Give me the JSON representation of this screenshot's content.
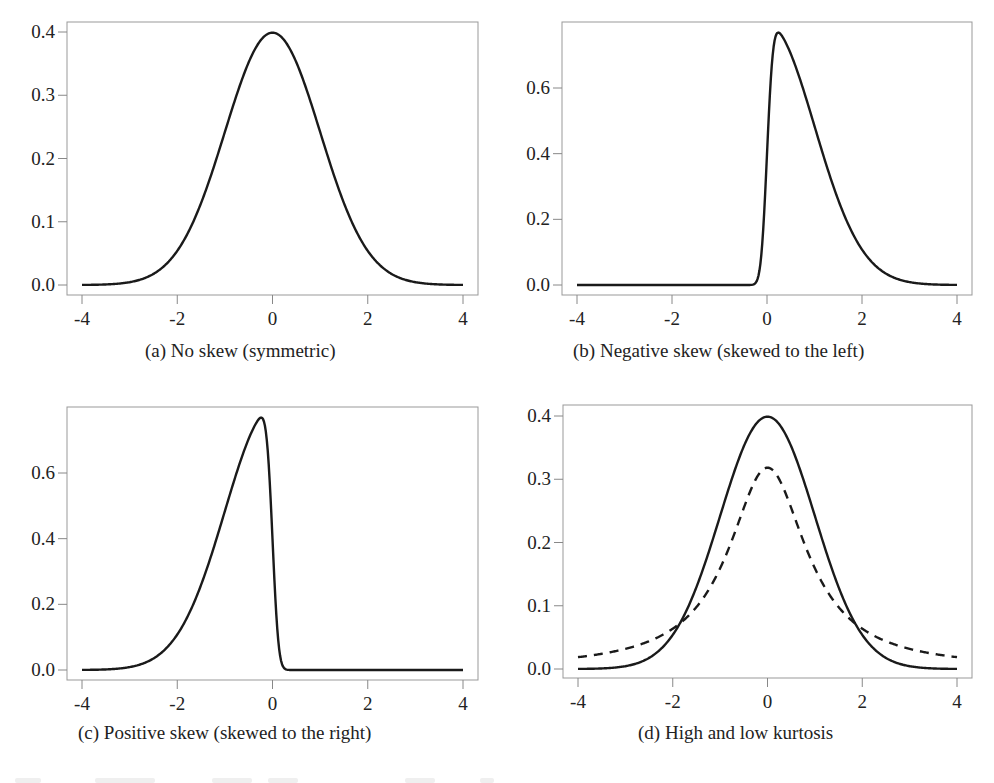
{
  "figure": {
    "panels": [
      {
        "id": "a",
        "caption": "(a)  No skew (symmetric)",
        "box": {
          "left": 67,
          "top": 22,
          "right": 478,
          "bottom": 295
        },
        "x_ticks": [
          -4,
          -2,
          0,
          2,
          4
        ],
        "x_tick_labels": [
          "-4",
          "-2",
          "0",
          "2",
          "4"
        ],
        "y_ticks": [
          0.0,
          0.1,
          0.2,
          0.3,
          0.4
        ],
        "y_tick_labels": [
          "0.0",
          "0.1",
          "0.2",
          "0.3",
          "0.4"
        ],
        "x_px": {
          "-4": 82,
          "4": 463
        },
        "y_px": {
          "0": 285,
          "top_value": 0.4,
          "top_px": 32
        },
        "caption_pos": {
          "left": 145,
          "top": 340
        }
      },
      {
        "id": "b",
        "caption": "(b)  Negative skew (skewed to the left)",
        "box": {
          "left": 562,
          "top": 22,
          "right": 972,
          "bottom": 295
        },
        "x_ticks": [
          -4,
          -2,
          0,
          2,
          4
        ],
        "x_tick_labels": [
          "-4",
          "-2",
          "0",
          "2",
          "4"
        ],
        "y_ticks": [
          0.0,
          0.2,
          0.4,
          0.6
        ],
        "y_tick_labels": [
          "0.0",
          "0.2",
          "0.4",
          "0.6"
        ],
        "x_px": {
          "-4": 577,
          "4": 957
        },
        "y_px": {
          "0": 285,
          "top_value": 0.6,
          "top_px": 88
        },
        "caption_pos": {
          "left": 573,
          "top": 340
        }
      },
      {
        "id": "c",
        "caption": "(c)  Positive skew (skewed to the right)",
        "box": {
          "left": 67,
          "top": 407,
          "right": 478,
          "bottom": 680
        },
        "x_ticks": [
          -4,
          -2,
          0,
          2,
          4
        ],
        "x_tick_labels": [
          "-4",
          "-2",
          "0",
          "2",
          "4"
        ],
        "y_ticks": [
          0.0,
          0.2,
          0.4,
          0.6
        ],
        "y_tick_labels": [
          "0.0",
          "0.2",
          "0.4",
          "0.6"
        ],
        "x_px": {
          "-4": 82,
          "4": 463
        },
        "y_px": {
          "0": 670,
          "top_value": 0.6,
          "top_px": 473
        },
        "caption_pos": {
          "left": 78,
          "top": 722
        }
      },
      {
        "id": "d",
        "caption": "(d)  High and low kurtosis",
        "box": {
          "left": 563,
          "top": 405,
          "right": 972,
          "bottom": 678
        },
        "x_ticks": [
          -4,
          -2,
          0,
          2,
          4
        ],
        "x_tick_labels": [
          "-4",
          "-2",
          "0",
          "2",
          "4"
        ],
        "y_ticks": [
          0.0,
          0.1,
          0.2,
          0.3,
          0.4
        ],
        "y_tick_labels": [
          "0.0",
          "0.1",
          "0.2",
          "0.3",
          "0.4"
        ],
        "x_px": {
          "-4": 578,
          "4": 957
        },
        "y_px": {
          "0": 669,
          "top_value": 0.4,
          "top_px": 416
        },
        "caption_pos": {
          "left": 638,
          "top": 722
        }
      }
    ],
    "colors": {
      "line": "#1a1a1a",
      "axis": "#888888",
      "box": "#999999",
      "text": "#222222"
    }
  },
  "chart_data": [
    {
      "type": "line",
      "title": "(a) No skew (symmetric)",
      "xlabel": "",
      "ylabel": "",
      "xlim": [
        -4,
        4
      ],
      "ylim": [
        0,
        0.4
      ],
      "x_ticks": [
        -4,
        -2,
        0,
        2,
        4
      ],
      "y_ticks": [
        0.0,
        0.1,
        0.2,
        0.3,
        0.4
      ],
      "grid": false,
      "series": [
        {
          "name": "Normal density",
          "style": "solid",
          "model": {
            "kind": "normal",
            "mu": 0,
            "sigma": 1
          },
          "x": [
            -4,
            -3,
            -2,
            -1,
            0,
            1,
            2,
            3,
            4
          ],
          "values": [
            0.0001,
            0.004,
            0.054,
            0.242,
            0.399,
            0.242,
            0.054,
            0.004,
            0.0001
          ]
        }
      ]
    },
    {
      "type": "line",
      "title": "(b) Negative skew (skewed to the left)",
      "xlabel": "",
      "ylabel": "",
      "xlim": [
        -4,
        4
      ],
      "ylim": [
        0,
        0.77
      ],
      "x_ticks": [
        -4,
        -2,
        0,
        2,
        4
      ],
      "y_ticks": [
        0.0,
        0.2,
        0.4,
        0.6
      ],
      "grid": false,
      "series": [
        {
          "name": "Skew-normal density",
          "style": "solid",
          "model": {
            "kind": "skewnormal",
            "alpha": 10
          },
          "x": [
            -4,
            -0.3,
            -0.1,
            0,
            0.25,
            0.5,
            1,
            1.5,
            2,
            2.5,
            3,
            4
          ],
          "values": [
            0,
            0.003,
            0.15,
            0.4,
            0.77,
            0.7,
            0.48,
            0.26,
            0.11,
            0.035,
            0.009,
            0.0001
          ]
        }
      ]
    },
    {
      "type": "line",
      "title": "(c) Positive skew (skewed to the right)",
      "xlabel": "",
      "ylabel": "",
      "xlim": [
        -4,
        4
      ],
      "ylim": [
        0,
        0.77
      ],
      "x_ticks": [
        -4,
        -2,
        0,
        2,
        4
      ],
      "y_ticks": [
        0.0,
        0.2,
        0.4,
        0.6
      ],
      "grid": false,
      "series": [
        {
          "name": "Skew-normal density",
          "style": "solid",
          "model": {
            "kind": "skewnormal",
            "alpha": -10
          },
          "x": [
            -4,
            -3,
            -2.5,
            -2,
            -1.5,
            -1,
            -0.5,
            -0.25,
            0,
            0.1,
            0.3,
            4
          ],
          "values": [
            0.0001,
            0.009,
            0.035,
            0.11,
            0.26,
            0.48,
            0.7,
            0.77,
            0.4,
            0.15,
            0.003,
            0
          ]
        }
      ]
    },
    {
      "type": "line",
      "title": "(d) High and low kurtosis",
      "xlabel": "",
      "ylabel": "",
      "xlim": [
        -4,
        4
      ],
      "ylim": [
        0,
        0.4
      ],
      "x_ticks": [
        -4,
        -2,
        0,
        2,
        4
      ],
      "y_ticks": [
        0.0,
        0.1,
        0.2,
        0.3,
        0.4
      ],
      "grid": false,
      "series": [
        {
          "name": "Normal (solid)",
          "style": "solid",
          "model": {
            "kind": "normal",
            "mu": 0,
            "sigma": 1
          },
          "x": [
            -4,
            -3,
            -2,
            -1,
            0,
            1,
            2,
            3,
            4
          ],
          "values": [
            0.0001,
            0.004,
            0.054,
            0.242,
            0.399,
            0.242,
            0.054,
            0.004,
            0.0001
          ]
        },
        {
          "name": "Cauchy (dashed)",
          "style": "dashed",
          "model": {
            "kind": "cauchy",
            "x0": 0,
            "gamma": 1
          },
          "x": [
            -4,
            -3,
            -2,
            -1,
            0,
            1,
            2,
            3,
            4
          ],
          "values": [
            0.019,
            0.032,
            0.064,
            0.159,
            0.318,
            0.159,
            0.064,
            0.032,
            0.019
          ]
        }
      ]
    }
  ]
}
